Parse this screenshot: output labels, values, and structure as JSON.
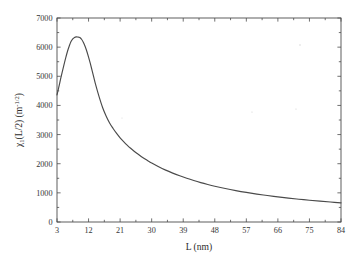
{
  "chart_data": {
    "type": "line",
    "title": "",
    "xlabel": "L (nm)",
    "ylabel": "χ₁(L/2) (m⁻¹ᐟ²)",
    "ylabel_parts": {
      "symbol": "χ",
      "subscript": "1",
      "arg": "(L/2) (m",
      "superscript": "-1/2",
      "tail": ")"
    },
    "xlim": [
      3,
      84
    ],
    "ylim": [
      0,
      7000
    ],
    "xticks": [
      3,
      12,
      21,
      30,
      39,
      48,
      57,
      66,
      75,
      84
    ],
    "yticks": [
      0,
      1000,
      2000,
      3000,
      4000,
      5000,
      6000,
      7000
    ],
    "xtick_labels": [
      "3",
      "12",
      "21",
      "30",
      "39",
      "48",
      "57",
      "66",
      "75",
      "84"
    ],
    "ytick_labels": [
      "0",
      "1000",
      "2000",
      "3000",
      "4000",
      "5000",
      "6000",
      "7000"
    ],
    "grid": false,
    "legend": null,
    "box": true,
    "tick_direction": "in",
    "line_color": "#4a4a4a",
    "background_color": "#ffffff",
    "axis_color": "#4d4d4d",
    "peak": {
      "x": 9.6,
      "y": 6350
    },
    "x": [
      3,
      3.5,
      4,
      4.5,
      5,
      5.5,
      6,
      6.5,
      7,
      7.5,
      8,
      8.5,
      9,
      9.3,
      9.6,
      10,
      10.5,
      11,
      11.5,
      12,
      12.5,
      13,
      13.5,
      14,
      15,
      16,
      17,
      18,
      19,
      20,
      21,
      22,
      23,
      24,
      25,
      26,
      27,
      28,
      29,
      30,
      32,
      34,
      36,
      38,
      40,
      42,
      44,
      46,
      48,
      51,
      54,
      57,
      60,
      63,
      66,
      69,
      72,
      75,
      78,
      81,
      84
    ],
    "y": [
      4360,
      4620,
      4890,
      5150,
      5400,
      5640,
      5860,
      6040,
      6190,
      6280,
      6335,
      6350,
      6345,
      6338,
      6320,
      6270,
      6170,
      6030,
      5860,
      5660,
      5440,
      5200,
      4960,
      4720,
      4300,
      3930,
      3640,
      3400,
      3210,
      3040,
      2890,
      2760,
      2640,
      2530,
      2430,
      2340,
      2250,
      2170,
      2095,
      2025,
      1895,
      1780,
      1678,
      1585,
      1500,
      1423,
      1352,
      1288,
      1228,
      1148,
      1078,
      1015,
      958,
      908,
      862,
      820,
      782,
      747,
      715,
      686,
      658
    ],
    "series_name": "chi1"
  },
  "figure": {
    "specks": [
      {
        "x": 300,
        "y": 45,
        "r": 0.7
      },
      {
        "x": 252,
        "y": 112,
        "r": 0.6
      },
      {
        "x": 296,
        "y": 109,
        "r": 0.6
      },
      {
        "x": 122,
        "y": 118,
        "r": 0.5
      }
    ]
  }
}
